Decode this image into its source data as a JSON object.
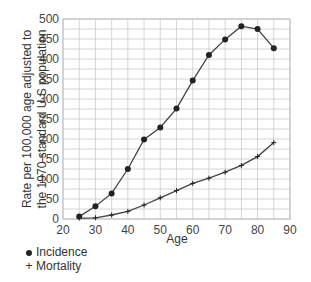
{
  "chart_data": {
    "type": "line",
    "title": "",
    "xlabel": "Age",
    "ylabel": "Rate per 100,000 age adjusted to the 1970 standard U.S population",
    "ylabel_lines": [
      "Rate per 100,000 age adjusted to",
      "the 1970 standard U.S population"
    ],
    "xlim": [
      20,
      90
    ],
    "ylim": [
      0,
      500
    ],
    "x_ticks": [
      20,
      30,
      40,
      50,
      60,
      70,
      80,
      90
    ],
    "y_ticks": [
      0,
      50,
      100,
      150,
      200,
      250,
      300,
      350,
      400,
      450,
      500
    ],
    "grid": true,
    "legend_position": "bottom-left",
    "x": [
      25,
      30,
      35,
      40,
      45,
      50,
      55,
      60,
      65,
      70,
      75,
      80,
      85
    ],
    "series": [
      {
        "name": "Incidence",
        "marker": "dot",
        "values": [
          6,
          32,
          64,
          125,
          199,
          229,
          276,
          346,
          410,
          449,
          482,
          475,
          427
        ]
      },
      {
        "name": "Mortality",
        "marker": "plus",
        "values": [
          2,
          3,
          10,
          19,
          35,
          53,
          71,
          89,
          102,
          117,
          134,
          156,
          191
        ]
      }
    ]
  },
  "legend": {
    "items": [
      {
        "label": "Incidence",
        "marker_symbol": "●"
      },
      {
        "label": "Mortality",
        "marker_symbol": "+"
      }
    ]
  },
  "colors": {
    "line": "#444444",
    "marker": "#222222",
    "grid": "#cccccc",
    "frame": "#bbbbbb"
  }
}
